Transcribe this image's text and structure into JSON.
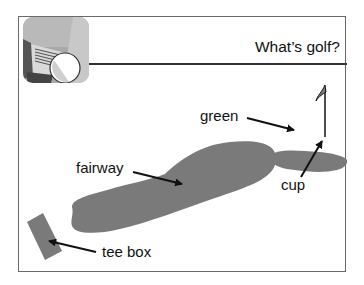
{
  "header": {
    "title": "What’s golf?",
    "icon": "golf-club-ball-icon"
  },
  "diagram": {
    "labels": {
      "green": "green",
      "fairway": "fairway",
      "cup": "cup",
      "tee_box": "tee box"
    },
    "colors": {
      "shape_fill": "#7a7a7a",
      "arrow": "#111111",
      "frame": "#6a6a6a"
    }
  }
}
